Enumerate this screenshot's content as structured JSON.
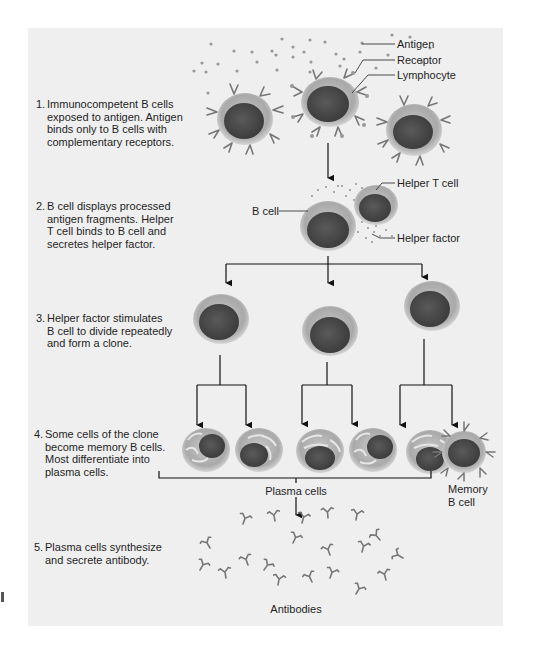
{
  "figure": {
    "steps": [
      {
        "num": "1.",
        "text": "Immunocompetent B cells\nexposed to antigen. Antigen\nbinds only to B cells with\ncomplementary receptors."
      },
      {
        "num": "2.",
        "text": "B cell displays processed\nantigen fragments. Helper\nT cell binds to B cell and\nsecretes helper factor."
      },
      {
        "num": "3.",
        "text": "Helper factor stimulates\nB cell to divide repeatedly\nand form a clone."
      },
      {
        "num": "4.",
        "text": "Some cells of the clone\nbecome memory B cells.\nMost differentiate into\nplasma cells."
      },
      {
        "num": "5.",
        "text": "Plasma cells synthesize\nand secrete antibody."
      }
    ],
    "labels": {
      "antigen": "Antigen",
      "receptor": "Receptor",
      "lymphocyte": "Lymphocyte",
      "helper_t_cell": "Helper T cell",
      "b_cell": "B cell",
      "helper_factor": "Helper factor",
      "plasma_cells": "Plasma cells",
      "memory_b_cell": "Memory\nB cell",
      "antibodies": "Antibodies"
    },
    "colors": {
      "panel_bg": "#efefef",
      "cell_outer": "#a8a8a8",
      "cell_nucleus": "#4a4a4a",
      "receptor": "#7a7a7a",
      "line": "#111111"
    }
  }
}
